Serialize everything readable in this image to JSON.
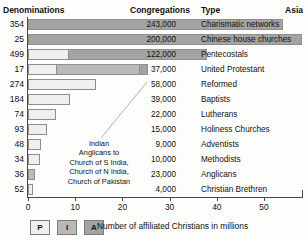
{
  "header": {
    "denominations": "Denominations",
    "congregations": "Congregations",
    "type": "Type",
    "region": "Asia"
  },
  "annotation": {
    "line1": "Indian",
    "line2": "Anglicans to",
    "line3": "Church of S India,",
    "line4": "Church of N India,",
    "line5": "Church of Pakistan"
  },
  "legend": {
    "items": [
      {
        "key": "P",
        "color": "#f0efed"
      },
      {
        "key": "I",
        "color": "#b9b9b7"
      },
      {
        "key": "A",
        "color": "#a3a3a1"
      }
    ],
    "caption": "Number of affiliated Christians in millions"
  },
  "chart_data": {
    "type": "bar",
    "orientation": "horizontal",
    "stacked": true,
    "title": "",
    "xlabel": "Number of affiliated Christians in millions",
    "ylabel": "",
    "xlim": [
      0,
      58
    ],
    "xticks": [
      0,
      10,
      20,
      30,
      40,
      50
    ],
    "grid": false,
    "legend_position": "bottom-left",
    "series_names": [
      "P",
      "I",
      "A"
    ],
    "categories": [
      "Charismatic networks",
      "Chinese house churches",
      "Pentecostals",
      "United Protestant",
      "Reformed",
      "Baptists",
      "Lutherans",
      "Holiness Churches",
      "Adventists",
      "Methodists",
      "Anglicans",
      "Christian Brethren"
    ],
    "denominations": [
      354,
      25,
      499,
      17,
      274,
      184,
      74,
      93,
      48,
      34,
      36,
      52
    ],
    "congregations": [
      "243,000",
      "200,000",
      "122,000",
      "37,000",
      "58,000",
      "39,000",
      "22,000",
      "15,000",
      "9,000",
      "10,000",
      "23,000",
      "4,000"
    ],
    "rows": [
      {
        "category": "Charismatic networks",
        "denominations": 354,
        "congregations": "243,000",
        "total": 54.0,
        "segments": [
          {
            "s": "a",
            "v": 54.0
          }
        ]
      },
      {
        "category": "Chinese house churches",
        "denominations": 25,
        "congregations": "200,000",
        "total": 58.0,
        "segments": [
          {
            "s": "a",
            "v": 58.0
          }
        ]
      },
      {
        "category": "Pentecostals",
        "denominations": 499,
        "congregations": "122,000",
        "total": 38.0,
        "segments": [
          {
            "s": "p",
            "v": 8.5
          },
          {
            "s": "a",
            "v": 29.5
          }
        ]
      },
      {
        "category": "United Protestant",
        "denominations": 17,
        "congregations": "37,000",
        "total": 25.5,
        "segments": [
          {
            "s": "p",
            "v": 6.0
          },
          {
            "s": "i",
            "v": 17.5
          },
          {
            "s": "a",
            "v": 2.0
          }
        ]
      },
      {
        "category": "Reformed",
        "denominations": 274,
        "congregations": "58,000",
        "total": 14.5,
        "segments": [
          {
            "s": "p",
            "v": 14.5
          }
        ]
      },
      {
        "category": "Baptists",
        "denominations": 184,
        "congregations": "39,000",
        "total": 9.0,
        "segments": [
          {
            "s": "p",
            "v": 9.0
          }
        ]
      },
      {
        "category": "Lutherans",
        "denominations": 74,
        "congregations": "22,000",
        "total": 6.0,
        "segments": [
          {
            "s": "p",
            "v": 6.0
          }
        ]
      },
      {
        "category": "Holiness Churches",
        "denominations": 93,
        "congregations": "15,000",
        "total": 4.0,
        "segments": [
          {
            "s": "p",
            "v": 4.0
          }
        ]
      },
      {
        "category": "Adventists",
        "denominations": 48,
        "congregations": "9,000",
        "total": 2.8,
        "segments": [
          {
            "s": "p",
            "v": 2.8
          }
        ]
      },
      {
        "category": "Methodists",
        "denominations": 34,
        "congregations": "10,000",
        "total": 2.6,
        "segments": [
          {
            "s": "p",
            "v": 2.6
          }
        ]
      },
      {
        "category": "Anglicans",
        "denominations": 36,
        "congregations": "23,000",
        "total": 1.4,
        "segments": [
          {
            "s": "i",
            "v": 1.4
          }
        ]
      },
      {
        "category": "Christian Brethren",
        "denominations": 52,
        "congregations": "4,000",
        "total": 1.0,
        "segments": [
          {
            "s": "p",
            "v": 1.0
          }
        ]
      }
    ]
  }
}
